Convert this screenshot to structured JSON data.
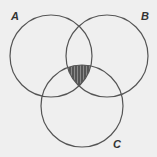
{
  "diagram": {
    "type": "venn",
    "sets": [
      {
        "label": "A",
        "cx": 51,
        "cy": 56,
        "r": 41
      },
      {
        "label": "B",
        "cx": 107,
        "cy": 56,
        "r": 41
      },
      {
        "label": "C",
        "cx": 82,
        "cy": 106,
        "r": 41
      }
    ],
    "shaded_region": "A ∩ B ∩ C",
    "colors": {
      "background": "#efefef",
      "stroke": "#555555",
      "shade": "#555555",
      "stripe": "#8a8a8a"
    }
  }
}
